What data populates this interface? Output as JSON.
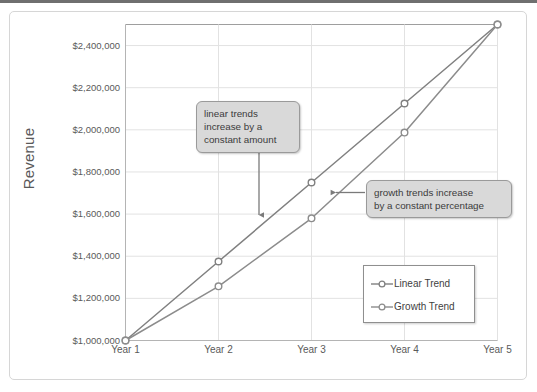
{
  "chart_data": {
    "type": "line",
    "title": "",
    "xlabel": "",
    "ylabel": "Revenue",
    "categories": [
      "Year 1",
      "Year 2",
      "Year 3",
      "Year 4",
      "Year 5"
    ],
    "ylim": [
      1000000,
      2500000
    ],
    "ytick_values": [
      1000000,
      1200000,
      1400000,
      1600000,
      1800000,
      2000000,
      2200000,
      2400000
    ],
    "ytick_labels": [
      "$1,000,000",
      "$1,200,000",
      "$1,400,000",
      "$1,600,000",
      "$1,800,000",
      "$2,000,000",
      "$2,200,000",
      "$2,400,000"
    ],
    "grid": true,
    "legend_position": "inside-lower-right",
    "series": [
      {
        "name": "Linear Trend",
        "values": [
          1000000,
          1375000,
          1750000,
          2125000,
          2500000
        ],
        "color": "#808080",
        "marker": "open-circle"
      },
      {
        "name": "Growth Trend",
        "values": [
          1000000,
          1257000,
          1580000,
          1987000,
          2500000
        ],
        "color": "#8c8c8c",
        "marker": "open-circle"
      }
    ],
    "annotations": [
      {
        "id": "linear-callout",
        "text": "linear trends\nincrease by a\nconstant amount",
        "arrow": "down",
        "points_at_series": "Linear Trend"
      },
      {
        "id": "growth-callout",
        "text": "growth trends increase\nby a constant percentage",
        "arrow": "left",
        "points_at_series": "Growth Trend"
      }
    ]
  },
  "axis": {
    "y_title": "Revenue"
  },
  "legend": {
    "entries": [
      {
        "label": "Linear Trend"
      },
      {
        "label": "Growth Trend"
      }
    ]
  },
  "colors": {
    "line": "#808080",
    "grid": "#e2e2e2",
    "axis": "#b4b4b4",
    "callout_fill": "#d9d9d9",
    "callout_border": "#9a9a9a",
    "text": "#595959",
    "frame_border": "#d6d6d6",
    "top_rule": "#6f6f6f"
  }
}
